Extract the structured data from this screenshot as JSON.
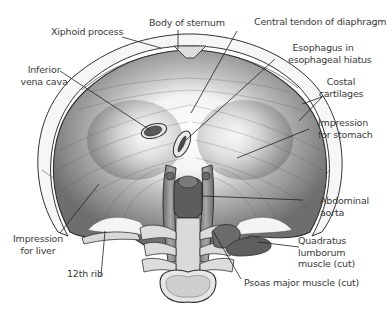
{
  "figure": {
    "colors": {
      "muscle_dark": "#6f6f6f",
      "muscle_mid": "#9a9a9a",
      "tendon_light": "#f4f4f4",
      "cartilage": "#f7f7f7",
      "bone": "#d7d7d7",
      "outline": "#2f2f2f",
      "label_text": "#3a3a3a"
    }
  },
  "labels": {
    "body_of_sternum": "Body of sternum",
    "xiphoid_process": "Xiphoid process",
    "central_tendon": "Central tendon of diaphragm",
    "esophagus_1": "Esophagus in",
    "esophagus_2": "esophageal hiatus",
    "inferior_vena_cava_1": "Inferior",
    "inferior_vena_cava_2": "vena cava",
    "costal_cartilages_1": "Costal",
    "costal_cartilages_2": "cartilages",
    "impression_stomach_1": "Impression",
    "impression_stomach_2": "for stomach",
    "abdominal_aorta_1": "Abdominal",
    "abdominal_aorta_2": "aorta",
    "impression_liver_1": "Impression",
    "impression_liver_2": "for liver",
    "twelfth_rib": "12th rib",
    "quadratus_1": "Quadratus",
    "quadratus_2": "lumborum",
    "quadratus_3": "muscle (cut)",
    "psoas_major": "Psoas major muscle (cut)"
  }
}
